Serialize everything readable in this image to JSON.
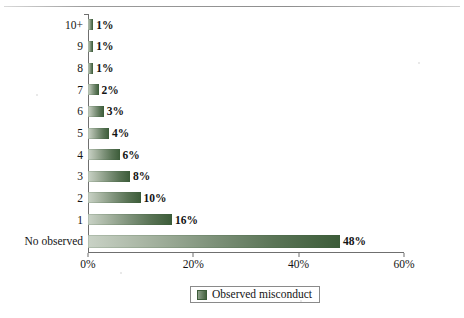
{
  "chart_data": {
    "type": "bar",
    "orientation": "horizontal",
    "title": "",
    "xlabel": "",
    "ylabel": "",
    "xlim": [
      0,
      60
    ],
    "xtick_labels": [
      "0%",
      "20%",
      "40%",
      "60%"
    ],
    "xtick_values": [
      0,
      20,
      40,
      60
    ],
    "grid": false,
    "legend_position": "bottom-center",
    "categories": [
      "10+",
      "9",
      "8",
      "7",
      "6",
      "5",
      "4",
      "3",
      "2",
      "1",
      "No observed"
    ],
    "values": [
      1,
      1,
      1,
      2,
      3,
      4,
      6,
      8,
      10,
      16,
      48
    ],
    "data_labels": [
      "1%",
      "1%",
      "1%",
      "2%",
      "3%",
      "4%",
      "6%",
      "8%",
      "10%",
      "16%",
      "48%"
    ],
    "series": [
      {
        "name": "Observed misconduct",
        "values": [
          1,
          1,
          1,
          2,
          3,
          4,
          6,
          8,
          10,
          16,
          48
        ]
      }
    ],
    "legend": [
      "Observed misconduct"
    ],
    "colors": {
      "bar_gradient_start": "#c9d2c6",
      "bar_gradient_end": "#3c5c39",
      "axis": "#6f6f6f",
      "text": "#141414",
      "background": "#ffffff"
    }
  },
  "legend": {
    "label": "Observed misconduct",
    "swatch_name": "legend-swatch"
  },
  "page": {
    "top_crumb": ""
  }
}
